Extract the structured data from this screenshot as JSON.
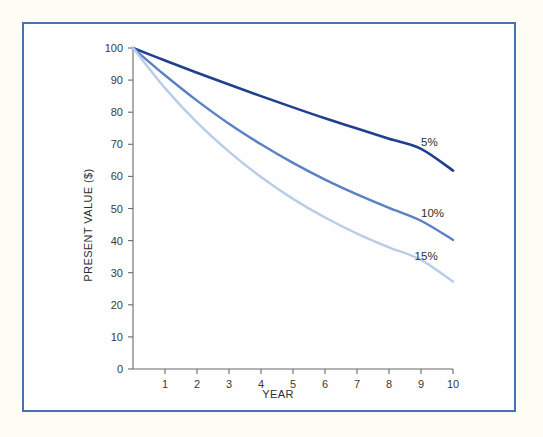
{
  "figure": {
    "background_color": "#fdfdf3",
    "panel_color": "#fefefe",
    "frame_color": "#4a6fb5"
  },
  "chart_data": {
    "type": "line",
    "title": "",
    "xlabel": "YEAR",
    "ylabel": "PRESENT VALUE ($)",
    "xlim": [
      0,
      10
    ],
    "ylim": [
      0,
      100
    ],
    "grid": false,
    "legend_position": "inline-right",
    "xticks": [
      1,
      2,
      3,
      4,
      5,
      6,
      7,
      8,
      9,
      10
    ],
    "xtick_labels": [
      "1",
      "2",
      "3",
      "4",
      "5",
      "6",
      "7",
      "8",
      "9",
      "10"
    ],
    "yticks": [
      0,
      10,
      20,
      30,
      40,
      50,
      60,
      70,
      80,
      90,
      100
    ],
    "ytick_labels": [
      "0",
      "10",
      "20",
      "30",
      "40",
      "50",
      "60",
      "70",
      "80",
      "90",
      "100"
    ],
    "x": [
      0,
      1,
      2,
      3,
      4,
      5,
      6,
      7,
      8,
      9,
      10
    ],
    "series": [
      {
        "name": "5%",
        "label": "5%",
        "color": "#1f3f8f",
        "width": 2.6,
        "values": [
          100,
          96.1,
          92.3,
          88.6,
          85.0,
          81.5,
          78.1,
          74.9,
          71.7,
          68.6,
          61.8
        ]
      },
      {
        "name": "10%",
        "label": "10%",
        "color": "#5b80c4",
        "width": 2.4,
        "values": [
          100,
          91.5,
          83.6,
          76.4,
          70.0,
          64.2,
          59.0,
          54.4,
          50.2,
          46.2,
          40.2
        ]
      },
      {
        "name": "15%",
        "label": "15%",
        "color": "#b9cce8",
        "width": 2.4,
        "values": [
          100,
          87.5,
          76.8,
          67.7,
          59.8,
          53.0,
          47.2,
          42.2,
          37.9,
          34.0,
          27.2
        ]
      }
    ],
    "annotations": [
      {
        "text": "5%",
        "x": 9.0,
        "y": 69.5
      },
      {
        "text": "10%",
        "x": 9.0,
        "y": 47.5
      },
      {
        "text": "15%",
        "x": 8.8,
        "y": 34.0
      }
    ]
  }
}
